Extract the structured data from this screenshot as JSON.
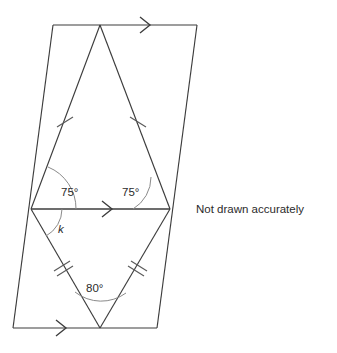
{
  "figure": {
    "note": "Not drawn accurately",
    "labels": {
      "angle_left_upper": "75°",
      "angle_right_upper": "75°",
      "angle_bottom_apex": "80°",
      "unknown_angle": "k"
    },
    "colors": {
      "stroke": "#3c3c3c",
      "arc": "#8a8a8a",
      "tick": "#5a5a5a",
      "text": "#2b2b2b",
      "background": "#ffffff"
    },
    "points": {
      "top_left": {
        "x": 53,
        "y": 25
      },
      "top_right": {
        "x": 197,
        "y": 25
      },
      "bottom_left": {
        "x": 13,
        "y": 328
      },
      "bottom_right": {
        "x": 157,
        "y": 328
      },
      "top_apex": {
        "x": 100,
        "y": 25
      },
      "mid_left": {
        "x": 31,
        "y": 209
      },
      "mid_right": {
        "x": 170,
        "y": 209
      },
      "bottom_apex": {
        "x": 100,
        "y": 328
      }
    },
    "segments": [
      {
        "name": "parallelogram-left-edge",
        "from": "top_left",
        "to": "bottom_left"
      },
      {
        "name": "parallelogram-top-edge",
        "from": "top_left",
        "to": "top_right"
      },
      {
        "name": "parallelogram-right-edge",
        "from": "top_right",
        "to": "bottom_right"
      },
      {
        "name": "parallelogram-bottom-edge",
        "from": "bottom_left",
        "to": "bottom_right"
      },
      {
        "name": "upper-triangle-left-side",
        "from": "top_apex",
        "to": "mid_left"
      },
      {
        "name": "upper-triangle-right-side",
        "from": "top_apex",
        "to": "mid_right"
      },
      {
        "name": "lower-triangle-left-side",
        "from": "mid_left",
        "to": "bottom_apex"
      },
      {
        "name": "lower-triangle-right-side",
        "from": "mid_right",
        "to": "bottom_apex"
      },
      {
        "name": "transversal-midline",
        "from": "mid_left",
        "to": "mid_right"
      }
    ],
    "tick_marks": {
      "upper_single_count": 1,
      "lower_double_count": 2
    },
    "arrows": [
      {
        "name": "top-edge-arrow",
        "x": 148,
        "y": 25
      },
      {
        "name": "midline-arrow",
        "x": 110,
        "y": 209
      },
      {
        "name": "bottom-edge-arrow",
        "x": 64,
        "y": 328
      }
    ]
  }
}
